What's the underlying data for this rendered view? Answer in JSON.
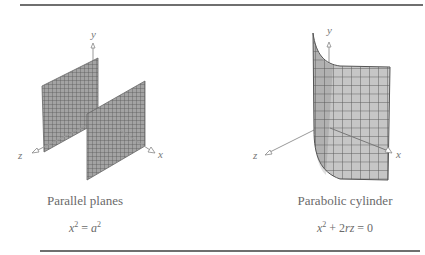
{
  "figures": [
    {
      "id": "parallel-planes",
      "caption": "Parallel planes",
      "equation": {
        "lhs_var": "x",
        "lhs_exp": "2",
        "eq": " = ",
        "rhs_var": "a",
        "rhs_exp": "2"
      },
      "axes": {
        "x": "x",
        "y": "y",
        "z": "z"
      }
    },
    {
      "id": "parabolic-cylinder",
      "caption": "Parabolic cylinder",
      "equation": {
        "lhs_var": "x",
        "lhs_exp": "2",
        "plus": " + 2",
        "rz": "rz",
        "eq": " = ",
        "rhs": "0"
      },
      "axes": {
        "x": "x",
        "y": "y",
        "z": "z"
      }
    }
  ],
  "colors": {
    "rule": "#6f6f6f",
    "plane_fill": "#9a9a9a",
    "plane_grid": "#555555",
    "cylinder_fill": "#c4c4c4",
    "cylinder_grid": "#5a5a5a",
    "axis": "#999999",
    "text": "#6a6a6a"
  }
}
